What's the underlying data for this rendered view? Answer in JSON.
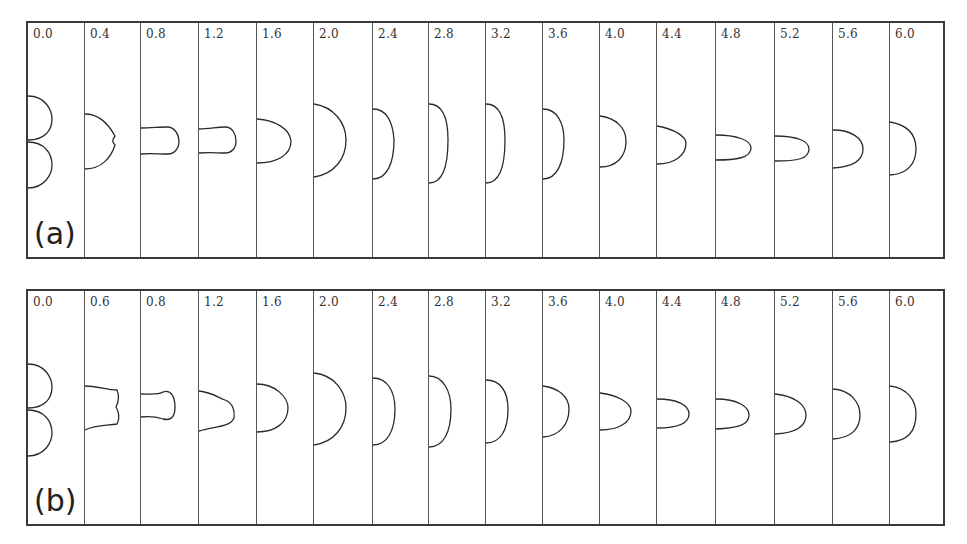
{
  "figure": {
    "panels": [
      {
        "id": "a",
        "label": "(a)",
        "times": [
          "0.0",
          "0.4",
          "0.8",
          "1.2",
          "1.6",
          "2.0",
          "2.4",
          "2.8",
          "3.2",
          "3.6",
          "4.0",
          "4.4",
          "4.8",
          "5.2",
          "5.6",
          "6.0"
        ]
      },
      {
        "id": "b",
        "label": "(b)",
        "times": [
          "0.0",
          "0.6",
          "0.8",
          "1.2",
          "1.6",
          "2.0",
          "2.4",
          "2.8",
          "3.2",
          "3.6",
          "4.0",
          "4.4",
          "4.8",
          "5.2",
          "5.6",
          "6.0"
        ]
      }
    ]
  }
}
